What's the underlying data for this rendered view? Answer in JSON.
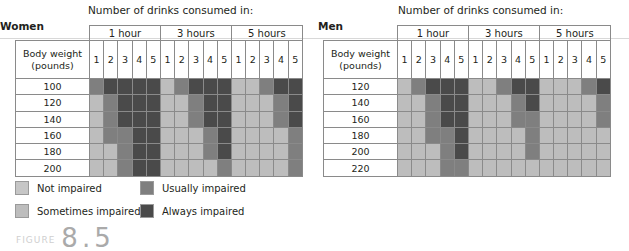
{
  "chart_data": [
    {
      "type": "heatmap",
      "title": "Women",
      "caption": "Number of drinks consumed in:",
      "row_header": "Body weight (pounds)",
      "groups": [
        "1 hour",
        "3 hours",
        "5 hours"
      ],
      "columns": [
        "1",
        "2",
        "3",
        "4",
        "5"
      ],
      "rows": [
        "100",
        "120",
        "140",
        "160",
        "180",
        "200"
      ],
      "values": [
        [
          "usually",
          "always",
          "always",
          "always",
          "always",
          "sometimes",
          "usually",
          "always",
          "always",
          "always",
          "sometimes",
          "sometimes",
          "usually",
          "always",
          "always"
        ],
        [
          "sometimes",
          "usually",
          "always",
          "always",
          "always",
          "sometimes",
          "sometimes",
          "usually",
          "always",
          "always",
          "sometimes",
          "sometimes",
          "sometimes",
          "usually",
          "always"
        ],
        [
          "sometimes",
          "usually",
          "always",
          "always",
          "always",
          "sometimes",
          "sometimes",
          "usually",
          "always",
          "always",
          "sometimes",
          "sometimes",
          "sometimes",
          "usually",
          "always"
        ],
        [
          "sometimes",
          "usually",
          "usually",
          "always",
          "always",
          "sometimes",
          "sometimes",
          "sometimes",
          "usually",
          "always",
          "sometimes",
          "sometimes",
          "sometimes",
          "sometimes",
          "usually"
        ],
        [
          "sometimes",
          "sometimes",
          "usually",
          "always",
          "always",
          "sometimes",
          "sometimes",
          "sometimes",
          "usually",
          "always",
          "sometimes",
          "sometimes",
          "sometimes",
          "sometimes",
          "usually"
        ],
        [
          "sometimes",
          "sometimes",
          "usually",
          "always",
          "always",
          "sometimes",
          "sometimes",
          "sometimes",
          "sometimes",
          "usually",
          "sometimes",
          "sometimes",
          "sometimes",
          "sometimes",
          "usually"
        ]
      ]
    },
    {
      "type": "heatmap",
      "title": "Men",
      "caption": "Number of drinks consumed in:",
      "row_header": "Body weight (pounds)",
      "groups": [
        "1 hour",
        "3 hours",
        "5 hours"
      ],
      "columns": [
        "1",
        "2",
        "3",
        "4",
        "5"
      ],
      "rows": [
        "120",
        "140",
        "160",
        "180",
        "200",
        "220"
      ],
      "values": [
        [
          "sometimes",
          "usually",
          "always",
          "always",
          "always",
          "sometimes",
          "sometimes",
          "usually",
          "always",
          "always",
          "sometimes",
          "sometimes",
          "sometimes",
          "usually",
          "always"
        ],
        [
          "sometimes",
          "sometimes",
          "usually",
          "always",
          "always",
          "sometimes",
          "sometimes",
          "sometimes",
          "usually",
          "always",
          "sometimes",
          "sometimes",
          "sometimes",
          "sometimes",
          "usually"
        ],
        [
          "sometimes",
          "sometimes",
          "usually",
          "always",
          "always",
          "sometimes",
          "sometimes",
          "sometimes",
          "usually",
          "usually",
          "sometimes",
          "sometimes",
          "sometimes",
          "sometimes",
          "usually"
        ],
        [
          "sometimes",
          "sometimes",
          "usually",
          "usually",
          "always",
          "sometimes",
          "sometimes",
          "sometimes",
          "sometimes",
          "usually",
          "sometimes",
          "sometimes",
          "sometimes",
          "sometimes",
          "sometimes"
        ],
        [
          "sometimes",
          "sometimes",
          "sometimes",
          "usually",
          "always",
          "sometimes",
          "sometimes",
          "sometimes",
          "sometimes",
          "usually",
          "sometimes",
          "sometimes",
          "sometimes",
          "sometimes",
          "sometimes"
        ],
        [
          "sometimes",
          "sometimes",
          "sometimes",
          "usually",
          "usually",
          "sometimes",
          "sometimes",
          "sometimes",
          "sometimes",
          "sometimes",
          "sometimes",
          "sometimes",
          "sometimes",
          "sometimes",
          "sometimes"
        ]
      ]
    }
  ],
  "legend": [
    {
      "key": "not",
      "label": "Not impaired",
      "color": "#c6c6c6"
    },
    {
      "key": "usually",
      "label": "Usually impaired",
      "color": "#7f7f7f"
    },
    {
      "key": "sometimes",
      "label": "Sometimes impaired",
      "color": "#bdbdbd"
    },
    {
      "key": "always",
      "label": "Always impaired",
      "color": "#4a4a4a"
    }
  ],
  "figure": {
    "label": "8.5"
  }
}
